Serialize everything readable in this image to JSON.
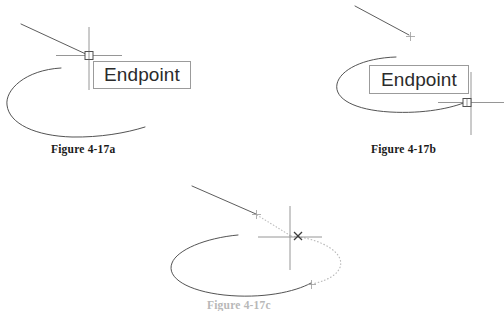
{
  "document": {
    "title": "Figure 4-17 Endpoint Object Snap",
    "background_color": "#ffffff",
    "width": 504,
    "height": 308
  },
  "colors": {
    "geometry_line": "#4a4a4a",
    "crosshair_line": "#7d7d7d",
    "marker_outline": "#555555",
    "tooltip_border": "#9b9b9b",
    "tooltip_text": "#2b2b2b",
    "caption_text": "#1a1a1a",
    "preview_dotted": "#bcbcbc",
    "faded_caption": "#b8b8b8"
  },
  "figures": [
    {
      "id": "figure-a",
      "caption": "Figure 4-17a",
      "tooltip_label": "Endpoint",
      "snap_marker": "endpoint-square-marker",
      "cursor": "crosshair-cursor",
      "geometry": [
        "line-segment",
        "arc"
      ],
      "description_visible_text": "Endpoint"
    },
    {
      "id": "figure-b",
      "caption": "Figure 4-17b",
      "tooltip_label": "Endpoint",
      "snap_marker": "endpoint-square-marker",
      "cursor": "crosshair-cursor",
      "geometry": [
        "line-segment",
        "arc",
        "plus-tick-marker"
      ],
      "description_visible_text": "Endpoint"
    },
    {
      "id": "figure-c",
      "caption": "Figure 4-17c",
      "tooltip_label": "",
      "snap_marker": "x-pick-marker",
      "cursor": "crosshair-cursor",
      "geometry": [
        "line-segment",
        "dotted-preview-line",
        "ellipse-arc",
        "dotted-preview-arc",
        "plus-tick-marker"
      ],
      "description_visible_text": ""
    }
  ],
  "captions": {
    "a": "Figure 4-17a",
    "b": "Figure 4-17b",
    "c": "Figure 4-17c"
  },
  "tooltips": {
    "a": "Endpoint",
    "b": "Endpoint"
  }
}
